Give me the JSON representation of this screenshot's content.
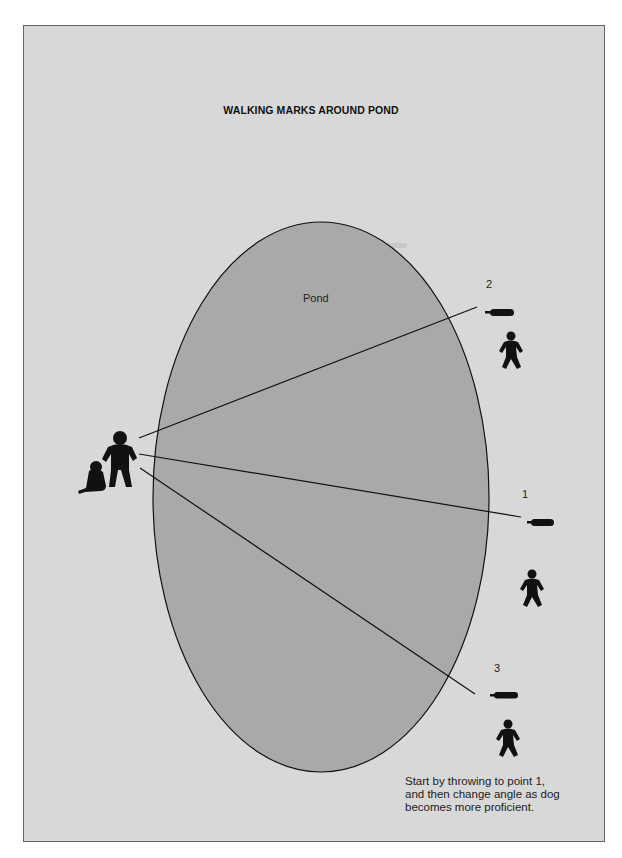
{
  "diagram": {
    "title": "WALKING MARKS AROUND POND",
    "pond_label": "Pond",
    "marks": [
      {
        "label": "2",
        "position": "upper-right"
      },
      {
        "label": "1",
        "position": "middle-right"
      },
      {
        "label": "3",
        "position": "lower-right"
      }
    ],
    "caption": [
      "Start by throwing to point 1,",
      "and then change angle as dog",
      "becomes more proficient."
    ],
    "icons": [
      "handler-with-dog-icon",
      "dummy-icon",
      "thrower-figure-icon"
    ],
    "colors": {
      "background": "#d8d8d8",
      "pond": "#a9a9a9",
      "ink": "#111111"
    }
  }
}
